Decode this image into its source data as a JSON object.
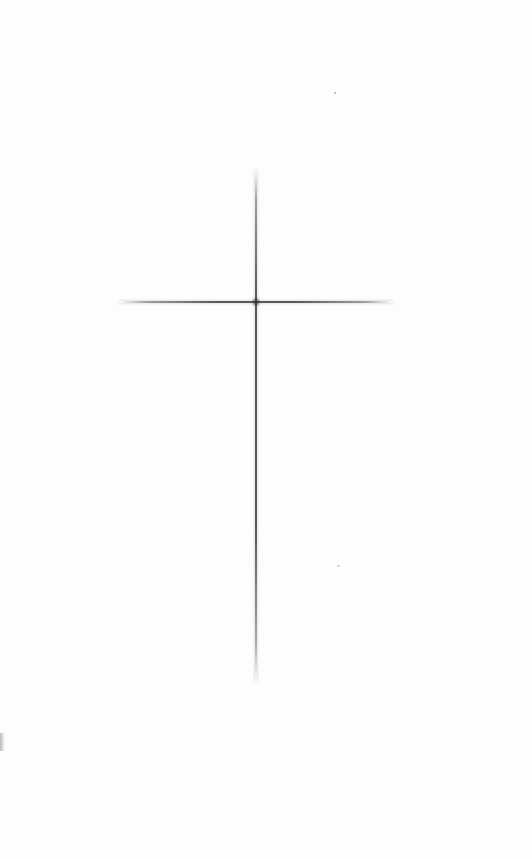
{
  "canvas": {
    "background_color": "#ffffff",
    "width": 532,
    "height": 859
  },
  "cross": {
    "icon": "cross-icon",
    "line_color": "#3c3c3c",
    "vertical": {
      "x": 256,
      "y_start": 170,
      "y_end": 682
    },
    "horizontal": {
      "y": 302,
      "x_start": 120,
      "x_end": 392
    }
  },
  "artifacts": [
    {
      "name": "speck",
      "x": 335,
      "y": 93
    },
    {
      "name": "speck",
      "x": 338,
      "y": 566
    },
    {
      "name": "edge-smudge",
      "x": 0,
      "y": 740
    }
  ]
}
